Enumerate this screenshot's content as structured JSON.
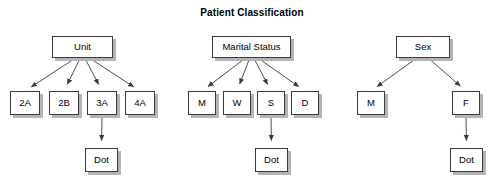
{
  "title": "Patient Classification",
  "colors": {
    "background": "#ffffff",
    "node_fill": "#ffffff",
    "node_border": "#3a3a3a",
    "node_shadow": "#b4b4b4",
    "edge": "#3a3a3a",
    "text": "#000000"
  },
  "trees": [
    {
      "name": "unit-tree",
      "root": {
        "id": "unit",
        "label": "Unit",
        "x": 52,
        "y": 36,
        "w": 61,
        "h": 22
      },
      "children": [
        {
          "id": "unit-2a",
          "label": "2A",
          "x": 10,
          "y": 91,
          "w": 30,
          "h": 24
        },
        {
          "id": "unit-2b",
          "label": "2B",
          "x": 49,
          "y": 91,
          "w": 30,
          "h": 24
        },
        {
          "id": "unit-3a",
          "label": "3A",
          "x": 87,
          "y": 91,
          "w": 30,
          "h": 24
        },
        {
          "id": "unit-4a",
          "label": "4A",
          "x": 125,
          "y": 91,
          "w": 30,
          "h": 24
        }
      ],
      "terminal": {
        "id": "unit-dot",
        "label": "Dot",
        "x": 85,
        "y": 148,
        "w": 33,
        "h": 24,
        "parent": "unit-3a"
      }
    },
    {
      "name": "marital-status-tree",
      "root": {
        "id": "marital-status",
        "label": "Marital Status",
        "x": 212,
        "y": 36,
        "w": 79,
        "h": 22
      },
      "children": [
        {
          "id": "marital-m",
          "label": "M",
          "x": 188,
          "y": 91,
          "w": 28,
          "h": 24
        },
        {
          "id": "marital-w",
          "label": "W",
          "x": 223,
          "y": 91,
          "w": 28,
          "h": 24
        },
        {
          "id": "marital-s",
          "label": "S",
          "x": 257,
          "y": 91,
          "w": 28,
          "h": 24
        },
        {
          "id": "marital-d",
          "label": "D",
          "x": 291,
          "y": 91,
          "w": 28,
          "h": 24
        }
      ],
      "terminal": {
        "id": "marital-dot",
        "label": "Dot",
        "x": 255,
        "y": 148,
        "w": 33,
        "h": 24,
        "parent": "marital-s"
      }
    },
    {
      "name": "sex-tree",
      "root": {
        "id": "sex",
        "label": "Sex",
        "x": 396,
        "y": 36,
        "w": 54,
        "h": 22
      },
      "children": [
        {
          "id": "sex-m",
          "label": "M",
          "x": 357,
          "y": 91,
          "w": 28,
          "h": 24
        },
        {
          "id": "sex-f",
          "label": "F",
          "x": 452,
          "y": 91,
          "w": 28,
          "h": 24
        }
      ],
      "terminal": {
        "id": "sex-dot",
        "label": "Dot",
        "x": 450,
        "y": 148,
        "w": 33,
        "h": 24,
        "parent": "sex-f"
      }
    }
  ]
}
